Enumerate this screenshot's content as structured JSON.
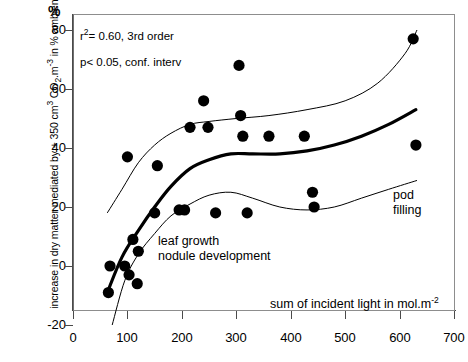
{
  "chart_data": {
    "type": "scatter",
    "title": "",
    "xlabel": "sum of incident light in mol.m-2",
    "ylabel": "increase in dry matter mediated by + 350 cm3 CO2.m-3 in % ambient",
    "y_unit_symbol": "%",
    "xlim": [
      0,
      700
    ],
    "ylim": [
      -20,
      80
    ],
    "xticks": [
      0,
      100,
      200,
      300,
      400,
      500,
      600,
      700
    ],
    "yticks": [
      -20,
      0,
      20,
      40,
      60,
      80
    ],
    "grid": false,
    "legend_position": "none",
    "marker_color": "#000000",
    "fit_color": "#000000",
    "ci_color": "#000000",
    "points": [
      {
        "x": 65,
        "y": -9
      },
      {
        "x": 68,
        "y": 0
      },
      {
        "x": 95,
        "y": 0
      },
      {
        "x": 100,
        "y": 37
      },
      {
        "x": 103,
        "y": -3
      },
      {
        "x": 110,
        "y": 9
      },
      {
        "x": 118,
        "y": -6
      },
      {
        "x": 120,
        "y": 5
      },
      {
        "x": 150,
        "y": 18
      },
      {
        "x": 155,
        "y": 34
      },
      {
        "x": 195,
        "y": 19
      },
      {
        "x": 205,
        "y": 19
      },
      {
        "x": 215,
        "y": 47
      },
      {
        "x": 240,
        "y": 56
      },
      {
        "x": 248,
        "y": 47
      },
      {
        "x": 262,
        "y": 18
      },
      {
        "x": 305,
        "y": 68
      },
      {
        "x": 308,
        "y": 51
      },
      {
        "x": 312,
        "y": 44
      },
      {
        "x": 320,
        "y": 18
      },
      {
        "x": 360,
        "y": 44
      },
      {
        "x": 425,
        "y": 44
      },
      {
        "x": 440,
        "y": 25
      },
      {
        "x": 443,
        "y": 20
      },
      {
        "x": 625,
        "y": 77
      },
      {
        "x": 630,
        "y": 41
      }
    ],
    "fit_curve": {
      "label": "3rd order polynomial fit",
      "points": [
        {
          "x": 63,
          "y": -9
        },
        {
          "x": 90,
          "y": 3
        },
        {
          "x": 120,
          "y": 12
        },
        {
          "x": 150,
          "y": 20
        },
        {
          "x": 180,
          "y": 27
        },
        {
          "x": 215,
          "y": 33
        },
        {
          "x": 250,
          "y": 36
        },
        {
          "x": 290,
          "y": 38
        },
        {
          "x": 330,
          "y": 38
        },
        {
          "x": 380,
          "y": 38
        },
        {
          "x": 430,
          "y": 39
        },
        {
          "x": 480,
          "y": 41
        },
        {
          "x": 530,
          "y": 44
        },
        {
          "x": 580,
          "y": 48
        },
        {
          "x": 630,
          "y": 53
        }
      ]
    },
    "confidence_upper": {
      "label": "upper 95% confidence interval",
      "points": [
        {
          "x": 63,
          "y": 18
        },
        {
          "x": 90,
          "y": 26
        },
        {
          "x": 120,
          "y": 35
        },
        {
          "x": 150,
          "y": 41
        },
        {
          "x": 180,
          "y": 45
        },
        {
          "x": 215,
          "y": 48
        },
        {
          "x": 250,
          "y": 49
        },
        {
          "x": 300,
          "y": 50
        },
        {
          "x": 360,
          "y": 51
        },
        {
          "x": 430,
          "y": 53
        },
        {
          "x": 500,
          "y": 56
        },
        {
          "x": 560,
          "y": 62
        },
        {
          "x": 610,
          "y": 72
        },
        {
          "x": 632,
          "y": 80
        }
      ]
    },
    "confidence_lower": {
      "label": "lower 95% confidence interval",
      "points": [
        {
          "x": 72,
          "y": -20
        },
        {
          "x": 95,
          "y": -5
        },
        {
          "x": 120,
          "y": 4
        },
        {
          "x": 150,
          "y": 11
        },
        {
          "x": 180,
          "y": 17
        },
        {
          "x": 215,
          "y": 21
        },
        {
          "x": 250,
          "y": 24
        },
        {
          "x": 290,
          "y": 25
        },
        {
          "x": 330,
          "y": 23
        },
        {
          "x": 380,
          "y": 20
        },
        {
          "x": 430,
          "y": 19
        },
        {
          "x": 480,
          "y": 20
        },
        {
          "x": 530,
          "y": 23
        },
        {
          "x": 580,
          "y": 26
        },
        {
          "x": 632,
          "y": 29
        }
      ]
    },
    "annotations": [
      {
        "name": "statistics-note",
        "text": "r2= 0.60, 3rd order\np< 0.05, conf. interv"
      },
      {
        "name": "leaf-growth-note",
        "text": "leaf growth\nnodule development"
      },
      {
        "name": "pod-filling-note",
        "text": "pod\nfilling"
      }
    ]
  },
  "axes": {
    "y_unit": "%",
    "y_label_parts": {
      "p1": "increase in dry matter mediated by + 350 cm",
      "sup1": "3",
      "p2": " CO",
      "sub1": "2",
      "p3": ".m",
      "sup2": "-3",
      "p4": " in % ambient"
    },
    "x_label_parts": {
      "p1": "sum of incident light in mol.m",
      "sup1": "-2"
    },
    "xticks": [
      "0",
      "100",
      "200",
      "300",
      "400",
      "500",
      "600",
      "700"
    ],
    "yticks": [
      "80",
      "60",
      "40",
      "20",
      "0",
      "-20"
    ]
  },
  "notes": {
    "stats": "r2= 0.60, 3rd order\np< 0.05, conf. interv",
    "stats_r": "r",
    "stats_sup": "2",
    "stats_rest": "= 0.60, 3rd order",
    "stats_line2": "p< 0.05, conf. interv",
    "leaf": "leaf growth\nnodule development",
    "pod": "pod\nfilling"
  }
}
